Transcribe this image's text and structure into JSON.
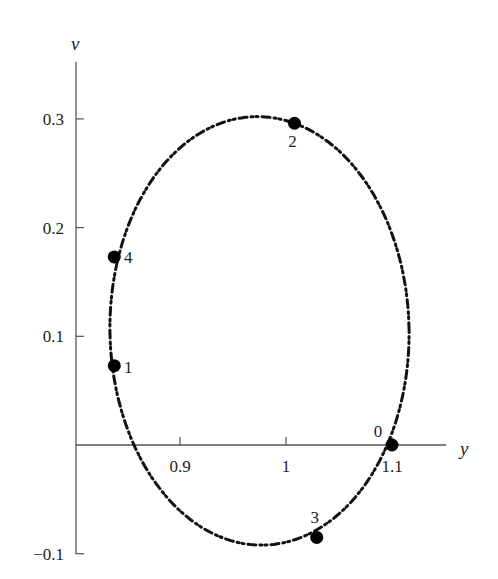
{
  "chart_data": {
    "type": "scatter",
    "title": "",
    "xlabel": "y",
    "ylabel": "v",
    "xlim": [
      0.8,
      1.155
    ],
    "ylim": [
      -0.1,
      0.35
    ],
    "x_ticks": [
      {
        "value": 0.9,
        "label": "0.9"
      },
      {
        "value": 1.0,
        "label": "1"
      },
      {
        "value": 1.1,
        "label": "1.1"
      }
    ],
    "y_ticks": [
      {
        "value": 0.3,
        "label": "0.3"
      },
      {
        "value": 0.2,
        "label": "0.2"
      },
      {
        "value": 0.1,
        "label": "0.1"
      },
      {
        "value": -0.1,
        "label": "−0.1"
      }
    ],
    "grid": false,
    "legend": null,
    "curve": {
      "style": "dash-dot-dot",
      "shape": "closed ellipse orbit",
      "center": [
        0.975,
        0.105
      ],
      "semi_axis_y": 0.142,
      "semi_axis_v": 0.197,
      "extents": {
        "y_min": 0.833,
        "y_max": 1.117,
        "v_min": -0.093,
        "v_max": 0.302
      }
    },
    "points": [
      {
        "label": "0",
        "y": 1.1,
        "v": 0.0
      },
      {
        "label": "1",
        "y": 0.838,
        "v": 0.073
      },
      {
        "label": "2",
        "y": 1.008,
        "v": 0.296
      },
      {
        "label": "3",
        "y": 1.029,
        "v": -0.085
      },
      {
        "label": "4",
        "y": 0.838,
        "v": 0.173
      }
    ]
  },
  "axes": {
    "x_title": "y",
    "y_title": "v"
  }
}
